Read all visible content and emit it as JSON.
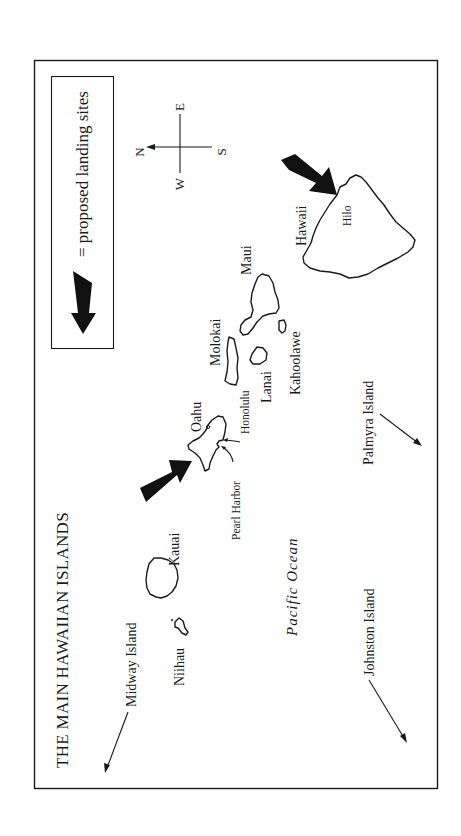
{
  "map": {
    "title": "THE MAIN HAWAIIAN ISLANDS",
    "legend": {
      "symbol": "landing-arrow-icon",
      "text": "= proposed landing sites"
    },
    "compass": {
      "north": "N",
      "south": "S",
      "east": "E",
      "west": "W"
    },
    "islands": {
      "hawaii": "Hawaii",
      "maui": "Maui",
      "molokai": "Molokai",
      "lanai": "Lanai",
      "kahoolawe": "Kahoolawe",
      "oahu": "Oahu",
      "kauai": "Kauai",
      "niihau": "Niihau"
    },
    "places": {
      "hilo": "Hilo",
      "honolulu": "Honolulu",
      "pearl_harbor": "Pearl Harbor"
    },
    "remote_islands": {
      "midway": "Midway Island",
      "johnston": "Johnston Island",
      "palmyra": "Palmyra Island"
    },
    "ocean": "Pacific Ocean",
    "landing_sites": [
      "Hilo",
      "Pearl Harbor"
    ],
    "colors": {
      "ink": "#1a1a1a",
      "background": "#ffffff"
    }
  }
}
